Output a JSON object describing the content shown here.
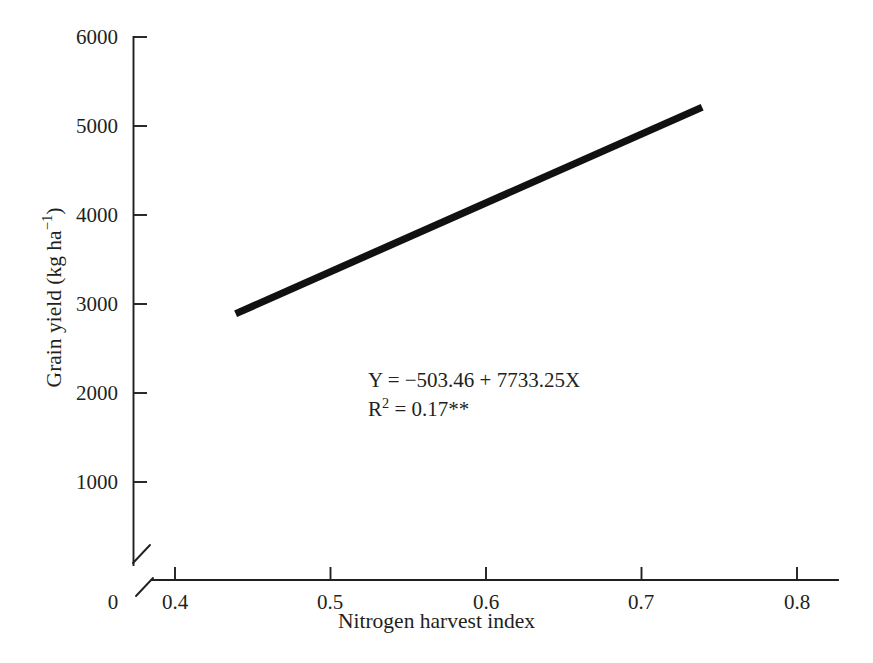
{
  "chart_data": {
    "type": "line",
    "title": "",
    "subtitle": "",
    "xlabel": "Nitrogen harvest index",
    "ylabel": "Grain yield (kg ha-1)",
    "ylabel_parts": {
      "main": "Grain yield (kg ha",
      "superscript": "−1",
      "tail": ")"
    },
    "xlim": [
      0.4,
      0.8
    ],
    "ylim": [
      0,
      6000
    ],
    "x_ticks": [
      {
        "label": "0",
        "value": 0
      },
      {
        "label": "0.4",
        "value": 0.4
      },
      {
        "label": "0.5",
        "value": 0.5
      },
      {
        "label": "0.6",
        "value": 0.6
      },
      {
        "label": "0.7",
        "value": 0.7
      },
      {
        "label": "0.8",
        "value": 0.8
      }
    ],
    "y_ticks": [
      {
        "label": "1000",
        "value": 1000
      },
      {
        "label": "2000",
        "value": 2000
      },
      {
        "label": "3000",
        "value": 3000
      },
      {
        "label": "4000",
        "value": 4000
      },
      {
        "label": "5000",
        "value": 5000
      },
      {
        "label": "6000",
        "value": 6000
      }
    ],
    "axis_break": true,
    "axis_break_note": "x-axis broken between 0 and 0.4",
    "grid": false,
    "legend": false,
    "series": [
      {
        "name": "Regression line",
        "color": "#111111",
        "x": [
          0.439,
          0.739
        ],
        "y": [
          2891,
          5211
        ]
      }
    ],
    "annotations": [
      {
        "text": "Y = −503.46 + 7733.25X",
        "x": 0.525,
        "y": 2300
      },
      {
        "text": "R2 = 0.17**",
        "x": 0.525,
        "y": 2050
      }
    ],
    "equation": {
      "line1": "Y = −503.46 + 7733.25X",
      "r_symbol": "R",
      "r_exponent": "2",
      "r_value": " = 0.17",
      "significance": "**"
    },
    "regression": {
      "intercept": -503.46,
      "slope": 7733.25,
      "r_squared": 0.17,
      "significance": "**"
    }
  },
  "colors": {
    "line": "#111111",
    "axis": "#231f20",
    "background": "#ffffff"
  }
}
